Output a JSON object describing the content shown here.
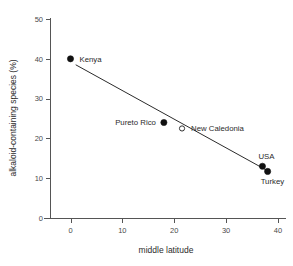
{
  "chart_data": {
    "type": "scatter",
    "title": "",
    "xlabel": "middle latitude",
    "ylabel": "alkaloid-containing species (%)",
    "xlim": [
      -5,
      42
    ],
    "ylim": [
      0,
      50
    ],
    "xticks": [
      "0",
      "10",
      "20",
      "30",
      "40"
    ],
    "xtick_values": [
      0,
      10,
      20,
      30,
      40
    ],
    "yticks": [
      "0",
      "10",
      "20",
      "30",
      "40",
      "50"
    ],
    "ytick_values": [
      0,
      10,
      20,
      30,
      40,
      50
    ],
    "grid": false,
    "legend": "none",
    "points": [
      {
        "label": "Kenya",
        "x": 0,
        "y": 40,
        "marker": "filled",
        "label_pos": "right"
      },
      {
        "label": "Pureto Rico",
        "x": 18,
        "y": 24,
        "marker": "filled",
        "label_pos": "left"
      },
      {
        "label": "New Caledonia",
        "x": 21.5,
        "y": 22.5,
        "marker": "open",
        "label_pos": "right"
      },
      {
        "label": "USA",
        "x": 37,
        "y": 13,
        "marker": "filled",
        "label_pos": "above"
      },
      {
        "label": "Turkey",
        "x": 38,
        "y": 11.7,
        "marker": "filled",
        "label_pos": "below-left"
      }
    ],
    "series": [
      {
        "name": "trend-line",
        "type": "line",
        "x": [
          1.0,
          38.5
        ],
        "y": [
          38.5,
          11.5
        ]
      }
    ],
    "colors": {
      "point_filled": "#111111",
      "point_open_stroke": "#333333",
      "point_open_fill": "#ffffff",
      "line": "#2b2b2b",
      "axis": "#555555",
      "text": "#2b2b2b",
      "background": "#ffffff"
    }
  }
}
